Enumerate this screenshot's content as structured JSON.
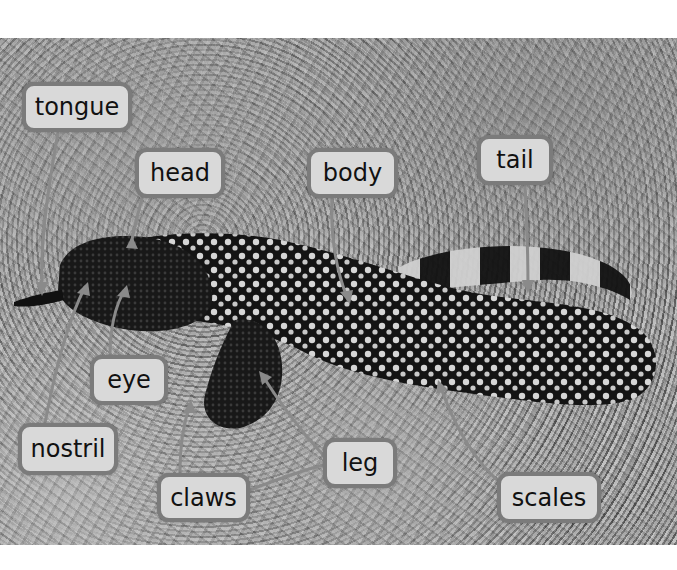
{
  "figure": {
    "colors": {
      "label_fill": "#d9d9d9",
      "label_border": "#7b7b7b",
      "label_text": "#111111",
      "leader_line": "#8a8a8a",
      "page_background": "#ffffff"
    },
    "labels": [
      {
        "id": "tongue",
        "text": "tongue",
        "box": [
          22,
          82,
          110,
          50
        ],
        "points_to": [
          42,
          290
        ]
      },
      {
        "id": "head",
        "text": "head",
        "box": [
          135,
          148,
          90,
          50
        ],
        "points_to": [
          132,
          240
        ]
      },
      {
        "id": "body",
        "text": "body",
        "box": [
          307,
          148,
          91,
          50
        ],
        "points_to": [
          348,
          300
        ]
      },
      {
        "id": "tail",
        "text": "tail",
        "box": [
          477,
          135,
          76,
          50
        ],
        "points_to": [
          528,
          288
        ]
      },
      {
        "id": "eye",
        "text": "eye",
        "box": [
          90,
          355,
          78,
          50
        ],
        "points_to": [
          125,
          290
        ]
      },
      {
        "id": "nostril",
        "text": "nostril",
        "box": [
          18,
          423,
          100,
          52
        ],
        "points_to": [
          85,
          287
        ]
      },
      {
        "id": "claws",
        "text": "claws",
        "box": [
          157,
          473,
          93,
          49
        ],
        "points_to": [
          190,
          405
        ]
      },
      {
        "id": "leg",
        "text": "leg",
        "box": [
          323,
          438,
          74,
          50
        ],
        "points_to": [
          262,
          375
        ]
      },
      {
        "id": "scales",
        "text": "scales",
        "box": [
          497,
          472,
          104,
          51
        ],
        "points_to": [
          440,
          385
        ]
      }
    ]
  }
}
